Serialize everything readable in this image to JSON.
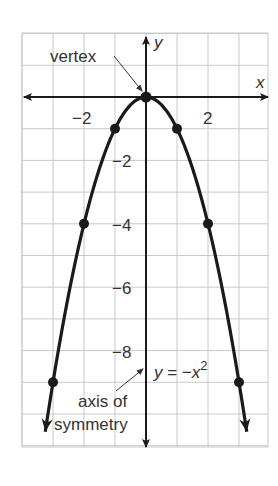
{
  "chart_data": {
    "type": "line",
    "title": "",
    "equation": "y = −x²",
    "xlabel": "x",
    "ylabel": "y",
    "xlim": [
      -4,
      4
    ],
    "ylim": [
      -11,
      2
    ],
    "grid": true,
    "x_ticks": [
      {
        "value": -2,
        "label": "−2"
      },
      {
        "value": 2,
        "label": "2"
      }
    ],
    "y_ticks": [
      {
        "value": -2,
        "label": "−2"
      },
      {
        "value": -4,
        "label": "−4"
      },
      {
        "value": -6,
        "label": "−6"
      },
      {
        "value": -8,
        "label": "−8"
      }
    ],
    "series": [
      {
        "name": "y = −x²",
        "points": [
          {
            "x": -3,
            "y": -9
          },
          {
            "x": -2,
            "y": -4
          },
          {
            "x": -1,
            "y": -1
          },
          {
            "x": 0,
            "y": 0
          },
          {
            "x": 1,
            "y": -1
          },
          {
            "x": 2,
            "y": -4
          },
          {
            "x": 3,
            "y": -9
          }
        ]
      }
    ],
    "annotations": [
      {
        "text": "vertex",
        "points_to": {
          "x": 0,
          "y": 0
        }
      },
      {
        "text": "axis of symmetry",
        "points_to": "y-axis (x = 0)"
      }
    ]
  },
  "labels": {
    "x_axis": "x",
    "y_axis": "y",
    "vertex": "vertex",
    "axis_line1": "axis of",
    "axis_line2": "symmetry",
    "eq_y": "y",
    "eq_mid": " = −",
    "eq_x": "x",
    "eq_exp": "2"
  },
  "colors": {
    "curve": "#1a1a1a",
    "grid": "#c8c8c8",
    "axes": "#1a1a1a",
    "text": "#333333"
  }
}
